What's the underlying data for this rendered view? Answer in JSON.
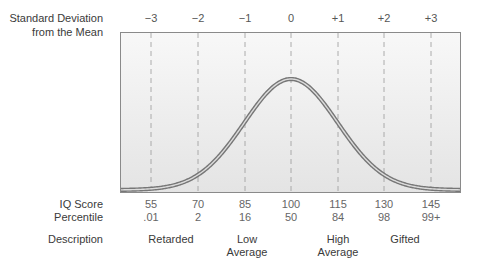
{
  "chart_data": {
    "type": "line",
    "title": "",
    "xlabel": "Standard Deviation from the Mean",
    "ylabel": "",
    "x": [
      -3,
      -2,
      -1,
      0,
      1,
      2,
      3
    ],
    "sd_tick_labels": [
      "−3",
      "−2",
      "−1",
      "0",
      "+1",
      "+2",
      "+3"
    ],
    "series": [
      {
        "name": "Normal distribution of IQ scores",
        "x": [
          -3.3,
          -3,
          -2,
          -1,
          0,
          1,
          2,
          3,
          3.3
        ],
        "values": [
          0.002,
          0.004,
          0.054,
          0.242,
          0.399,
          0.242,
          0.054,
          0.004,
          0.002
        ]
      }
    ],
    "rows": {
      "iq_score": {
        "label": "IQ Score",
        "values": [
          "55",
          "70",
          "85",
          "100",
          "115",
          "130",
          "145"
        ]
      },
      "percentile": {
        "label": "Percentile",
        "values": [
          ".01",
          "2",
          "16",
          "50",
          "84",
          "98",
          "99+"
        ]
      },
      "description": {
        "label": "Description",
        "values": [
          {
            "text": "Retarded",
            "at": -2.5
          },
          {
            "text": "Low\nAverage",
            "at": -1
          },
          {
            "text": "High\nAverage",
            "at": 1
          },
          {
            "text": "Gifted",
            "at": 1.85
          }
        ]
      }
    },
    "xlim": [
      -3.65,
      3.65
    ],
    "grid": "dashed vertical lines at each SD",
    "legend": "none"
  },
  "labels": {
    "sd_line1": "Standard Deviation",
    "sd_line2": "from the Mean",
    "iq": "IQ Score",
    "percentile": "Percentile",
    "description": "Description"
  },
  "ticks": [
    "−3",
    "−2",
    "−1",
    "0",
    "+1",
    "+2",
    "+3"
  ],
  "iq": [
    "55",
    "70",
    "85",
    "100",
    "115",
    "130",
    "145"
  ],
  "pct": [
    ".01",
    "2",
    "16",
    "50",
    "84",
    "98",
    "99+"
  ],
  "desc": {
    "retarded": "Retarded",
    "low1": "Low",
    "low2": "Average",
    "high1": "High",
    "high2": "Average",
    "gifted": "Gifted"
  },
  "colors": {
    "curve_outer": "#7a7a7a",
    "curve_inner": "#d8d8d8",
    "frame": "#8a8a8a",
    "grid": "#9a9a9a",
    "bg_top": "#f7f7f7",
    "bg_bottom": "#e6e6e6"
  }
}
